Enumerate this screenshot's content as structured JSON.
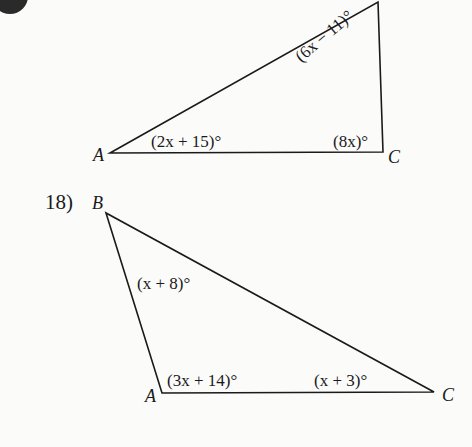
{
  "colors": {
    "background": "#fbfbfa",
    "ink": "#1a1a1a"
  },
  "problem17": {
    "badge_icon": "problem-number-badge",
    "triangle": {
      "vertices": {
        "A": {
          "label": "A",
          "x": 110,
          "y": 153
        },
        "B": {
          "label": "",
          "x": 378,
          "y": 2
        },
        "C": {
          "label": "C",
          "x": 383,
          "y": 152
        }
      },
      "angles": {
        "A": "(2x + 15)°",
        "B": "(6x − 11)°",
        "C": "(8x)°"
      }
    }
  },
  "problem18": {
    "number": "18)",
    "triangle": {
      "vertices": {
        "A": {
          "label": "A",
          "x": 162,
          "y": 393
        },
        "B": {
          "label": "B",
          "x": 106,
          "y": 213
        },
        "C": {
          "label": "C",
          "x": 434,
          "y": 392
        }
      },
      "angles": {
        "A": "(3x + 14)°",
        "B": "(x + 8)°",
        "C": "(x + 3)°"
      }
    }
  }
}
